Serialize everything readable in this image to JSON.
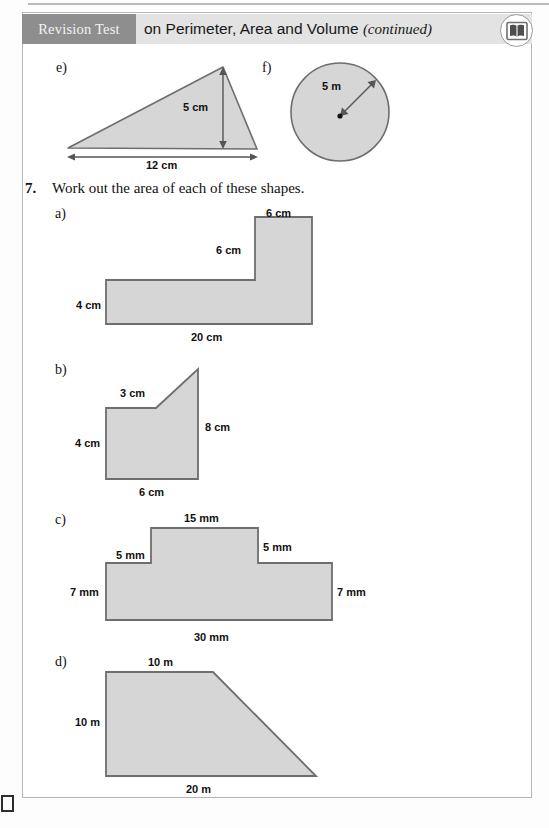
{
  "page": {
    "header": {
      "tag": "Revision Test",
      "title_main": "on Perimeter, Area and Volume",
      "title_continued": "(continued)",
      "badge_icon": "open-book-icon"
    },
    "colors": {
      "tag_background": "#8e8e8e",
      "band_background": "#e3e3e3",
      "shape_fill": "#d6d6d6",
      "shape_stroke": "#6e6e6e",
      "page_border": "#b5b5b5"
    }
  },
  "parts_top": {
    "e": {
      "label": "e)",
      "shape": "triangle",
      "height_label": "5 cm",
      "base_label": "12 cm"
    },
    "f": {
      "label": "f)",
      "shape": "circle",
      "radius_label": "5 m"
    }
  },
  "question": {
    "number": "7.",
    "text": "Work out the area of each of these shapes."
  },
  "parts": [
    {
      "key": "a",
      "label": "a)",
      "shape": "l-shape",
      "dimensions": [
        {
          "name": "top-right-width",
          "value": "6 cm"
        },
        {
          "name": "inner-vertical",
          "value": "6 cm"
        },
        {
          "name": "left-height",
          "value": "4 cm"
        },
        {
          "name": "bottom-width",
          "value": "20 cm"
        }
      ]
    },
    {
      "key": "b",
      "label": "b)",
      "shape": "right-trapezoid-step",
      "dimensions": [
        {
          "name": "top-width",
          "value": "3 cm"
        },
        {
          "name": "right-height",
          "value": "8 cm"
        },
        {
          "name": "left-height",
          "value": "4 cm"
        },
        {
          "name": "bottom-width",
          "value": "6 cm"
        }
      ]
    },
    {
      "key": "c",
      "label": "c)",
      "shape": "t-shape",
      "dimensions": [
        {
          "name": "top-width",
          "value": "15 mm"
        },
        {
          "name": "left-step",
          "value": "5 mm"
        },
        {
          "name": "right-step",
          "value": "5 mm"
        },
        {
          "name": "left-height",
          "value": "7 mm"
        },
        {
          "name": "right-height",
          "value": "7 mm"
        },
        {
          "name": "bottom-width",
          "value": "30 mm"
        }
      ]
    },
    {
      "key": "d",
      "label": "d)",
      "shape": "trapezium",
      "dimensions": [
        {
          "name": "top-width",
          "value": "10 m"
        },
        {
          "name": "left-height",
          "value": "10 m"
        },
        {
          "name": "bottom-width",
          "value": "20 m"
        }
      ]
    }
  ]
}
